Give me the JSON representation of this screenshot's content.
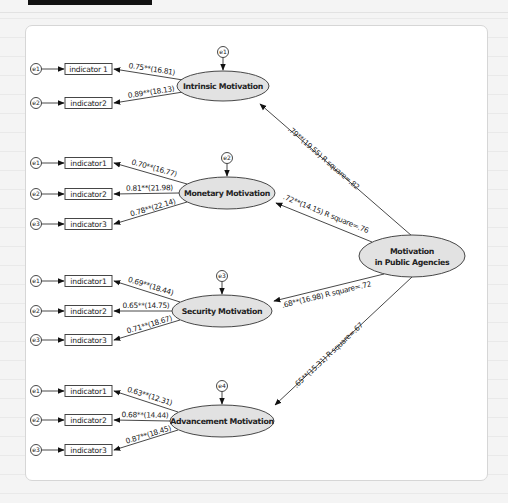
{
  "diagram": {
    "central": {
      "id": "mpa",
      "line1": "Motivation",
      "line2": "in Public Agencies",
      "cx": 412,
      "cy": 256,
      "rx": 53,
      "ry": 21
    },
    "colors": {
      "ellipse_fill": "#e2e2e2",
      "stroke": "#333333",
      "card_bg": "#ffffff"
    },
    "factors": [
      {
        "id": "intrinsic",
        "label": "Intrinsic Motivation",
        "cx": 223,
        "cy": 86,
        "rx": 46,
        "ry": 15,
        "error_label": "e1",
        "path": {
          "label": ".79**(19.55) R square=.82",
          "x1": 412,
          "y1": 236,
          "x2": 260,
          "y2": 104,
          "lx": 322,
          "ly": 160
        },
        "indicators": [
          {
            "label": "indicator 1",
            "y": 69,
            "error": "e1",
            "loading": "0.75**(16.81)"
          },
          {
            "label": "indicator2",
            "y": 103,
            "error": "e2",
            "loading": "0.89**(18.13)"
          }
        ]
      },
      {
        "id": "monetary",
        "label": "Monetary Motivation",
        "cx": 227,
        "cy": 193,
        "rx": 48,
        "ry": 16,
        "error_label": "e2",
        "path": {
          "label": ".72**(14.15) R square=.76",
          "x1": 372,
          "y1": 242,
          "x2": 276,
          "y2": 203,
          "lx": 325,
          "ly": 216
        },
        "indicators": [
          {
            "label": "indicator1",
            "y": 163,
            "error": "e1",
            "loading": "0.70**(16.77)"
          },
          {
            "label": "indicator2",
            "y": 194,
            "error": "e2",
            "loading": "0.81**(21.98)"
          },
          {
            "label": "indicator3",
            "y": 224,
            "error": "e3",
            "loading": "0.78**(22.14)"
          }
        ]
      },
      {
        "id": "security",
        "label": "Security Motivation",
        "cx": 222,
        "cy": 311,
        "rx": 50,
        "ry": 16,
        "error_label": "e3",
        "path": {
          "label": ".68**(16.98) R square=.72",
          "x1": 384,
          "y1": 274,
          "x2": 274,
          "y2": 301,
          "lx": 327,
          "ly": 297
        },
        "indicators": [
          {
            "label": "indicator1",
            "y": 281,
            "error": "e1",
            "loading": "0.69**(18.44)"
          },
          {
            "label": "indicator2",
            "y": 311,
            "error": "e2",
            "loading": "0.65**(14.75)"
          },
          {
            "label": "indicator3",
            "y": 340,
            "error": "e3",
            "loading": "0.71**(18.67)"
          }
        ]
      },
      {
        "id": "advancement",
        "label": "Advancement Motivation",
        "cx": 222,
        "cy": 421,
        "rx": 52,
        "ry": 16,
        "error_label": "e4",
        "path": {
          "label": ".65**(15.31) R square=.67",
          "x1": 412,
          "y1": 277,
          "x2": 275,
          "y2": 405,
          "lx": 330,
          "ly": 357
        },
        "indicators": [
          {
            "label": "indicator1",
            "y": 391,
            "error": "e1",
            "loading": "0.63**(12.31)"
          },
          {
            "label": "indicator2",
            "y": 420,
            "error": "e2",
            "loading": "0.68**(14.44)"
          },
          {
            "label": "indicator3",
            "y": 450,
            "error": "e3",
            "loading": "0.87**(18.45)"
          }
        ]
      }
    ]
  }
}
